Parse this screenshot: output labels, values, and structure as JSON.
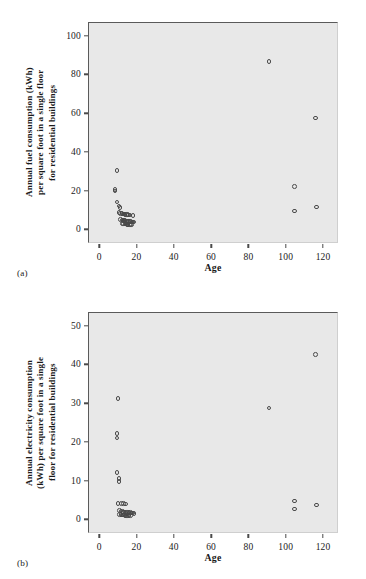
{
  "figure": {
    "background": "#ffffff",
    "plot_background": "#e8e8e8",
    "marker_color": "#4a4a4a",
    "axis_color": "#5a5a5a"
  },
  "panels": [
    {
      "caption": "(a)",
      "xlabel": "Age",
      "ylabel": "Annual fuel consumption (kWh)\nper square foot in a single floor\nfor residential buildings",
      "yticks": [
        "0",
        "20",
        "40",
        "60",
        "80",
        "100"
      ],
      "xticks": [
        "0",
        "20",
        "40",
        "60",
        "80",
        "100",
        "120"
      ]
    },
    {
      "caption": "(b)",
      "xlabel": "Age",
      "ylabel": "Annual electricity consumption\n(kWh) per square foot in a single\nfloor for residential buildings",
      "yticks": [
        "0",
        "10",
        "20",
        "30",
        "40",
        "50"
      ],
      "xticks": [
        "0",
        "20",
        "40",
        "60",
        "80",
        "100",
        "120"
      ]
    }
  ],
  "chart_data": [
    {
      "type": "scatter",
      "title": "",
      "subtitle": "(a)",
      "xlabel": "Age",
      "ylabel": "Annual fuel consumption (kWh) per square foot in a single floor for residential buildings",
      "xlim": [
        -6,
        128
      ],
      "ylim": [
        -7,
        107
      ],
      "xticks": [
        0,
        20,
        40,
        60,
        80,
        100,
        120
      ],
      "yticks": [
        0,
        20,
        40,
        60,
        80,
        100
      ],
      "grid": false,
      "legend": false,
      "marker": "open-circle",
      "series": [
        {
          "name": "Residential buildings",
          "points": [
            [
              9,
              31
            ],
            [
              8,
              21
            ],
            [
              8,
              20.4
            ],
            [
              9,
              14.7
            ],
            [
              10,
              12.5
            ],
            [
              10.6,
              11.8
            ],
            [
              10,
              9.2
            ],
            [
              11,
              8.8
            ],
            [
              11.6,
              8.6
            ],
            [
              12.2,
              8.5
            ],
            [
              12.8,
              8.4
            ],
            [
              13.4,
              8.3
            ],
            [
              14,
              8.2
            ],
            [
              14.6,
              8.1
            ],
            [
              15.2,
              8.0
            ],
            [
              16,
              7.9
            ],
            [
              17.6,
              7.6
            ],
            [
              11,
              5.6
            ],
            [
              11.6,
              5.4
            ],
            [
              12.2,
              5.2
            ],
            [
              12.8,
              5.1
            ],
            [
              13.4,
              5.0
            ],
            [
              14,
              4.9
            ],
            [
              14.6,
              4.8
            ],
            [
              15.2,
              4.7
            ],
            [
              15.8,
              4.6
            ],
            [
              16.4,
              4.5
            ],
            [
              17,
              4.4
            ],
            [
              17.6,
              4.4
            ],
            [
              18.2,
              4.3
            ],
            [
              12,
              3.6
            ],
            [
              12.6,
              3.5
            ],
            [
              13.2,
              3.4
            ],
            [
              13.8,
              3.3
            ],
            [
              14.4,
              3.2
            ],
            [
              15,
              3.2
            ],
            [
              15.6,
              3.1
            ],
            [
              16.2,
              3.1
            ],
            [
              16.8,
              3.0
            ],
            [
              90.5,
              87
            ],
            [
              115.5,
              58
            ],
            [
              104,
              22.6
            ],
            [
              116,
              12
            ],
            [
              104,
              10
            ]
          ]
        }
      ]
    },
    {
      "type": "scatter",
      "title": "",
      "subtitle": "(b)",
      "xlabel": "Age",
      "ylabel": "Annual electricity consumption (kWh) per square foot in a single floor for residential buildings",
      "xlim": [
        -6,
        128
      ],
      "ylim": [
        -3.5,
        53.5
      ],
      "xticks": [
        0,
        20,
        40,
        60,
        80,
        100,
        120
      ],
      "yticks": [
        0,
        10,
        20,
        30,
        40,
        50
      ],
      "grid": false,
      "legend": false,
      "marker": "open-circle",
      "series": [
        {
          "name": "Residential buildings",
          "points": [
            [
              9.5,
              31.4
            ],
            [
              9,
              22.4
            ],
            [
              9,
              21.3
            ],
            [
              9,
              12.4
            ],
            [
              10,
              10.8
            ],
            [
              10,
              10.0
            ],
            [
              9.5,
              4.4
            ],
            [
              11.5,
              4.3
            ],
            [
              12.5,
              4.3
            ],
            [
              13.5,
              4.2
            ],
            [
              10.5,
              2.6
            ],
            [
              11.2,
              2.4
            ],
            [
              11.9,
              2.3
            ],
            [
              12.6,
              2.2
            ],
            [
              13.3,
              2.2
            ],
            [
              14,
              2.1
            ],
            [
              14.7,
              2.1
            ],
            [
              15.4,
              2.0
            ],
            [
              16.1,
              2.0
            ],
            [
              16.8,
              1.9
            ],
            [
              17.5,
              1.9
            ],
            [
              18.2,
              1.8
            ],
            [
              10.5,
              1.5
            ],
            [
              11.2,
              1.5
            ],
            [
              11.9,
              1.4
            ],
            [
              12.6,
              1.4
            ],
            [
              13.3,
              1.3
            ],
            [
              14,
              1.3
            ],
            [
              14.7,
              1.2
            ],
            [
              15.4,
              1.2
            ],
            [
              16.1,
              1.2
            ],
            [
              115.5,
              42.8
            ],
            [
              90.5,
              29
            ],
            [
              104,
              5
            ],
            [
              116,
              4
            ],
            [
              104,
              3
            ]
          ]
        }
      ]
    }
  ]
}
